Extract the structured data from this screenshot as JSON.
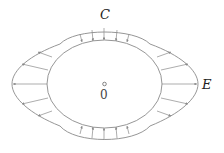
{
  "diagram": {
    "labels": {
      "top": "C",
      "right": "E",
      "center": "0"
    },
    "colors": {
      "stroke": "#8a8a8a",
      "text": "#222222",
      "background": "#ffffff"
    }
  }
}
